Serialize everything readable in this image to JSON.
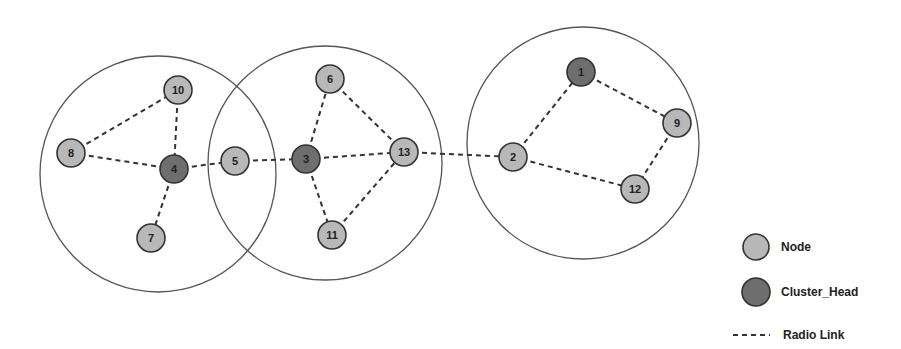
{
  "diagram": {
    "type": "cluster-network-topology",
    "colors": {
      "node_fill": "#b8b8b8",
      "cluster_head_fill": "#6e6e6e",
      "stroke": "#333333",
      "range_circle": "#555555",
      "link": "#333333"
    },
    "ranges": [
      {
        "id": "cluster-4",
        "cx": 158,
        "cy": 174,
        "r": 118
      },
      {
        "id": "cluster-3",
        "cx": 325,
        "cy": 163,
        "r": 117
      },
      {
        "id": "cluster-1",
        "cx": 583,
        "cy": 143,
        "r": 116
      }
    ],
    "nodes": [
      {
        "id": "1",
        "label": "1",
        "x": 581,
        "y": 72,
        "role": "cluster_head"
      },
      {
        "id": "2",
        "label": "2",
        "x": 513,
        "y": 157,
        "role": "node"
      },
      {
        "id": "3",
        "label": "3",
        "x": 306,
        "y": 159,
        "role": "cluster_head"
      },
      {
        "id": "4",
        "label": "4",
        "x": 174,
        "y": 169,
        "role": "cluster_head"
      },
      {
        "id": "5",
        "label": "5",
        "x": 235,
        "y": 161,
        "role": "node"
      },
      {
        "id": "6",
        "label": "6",
        "x": 330,
        "y": 79,
        "role": "node"
      },
      {
        "id": "7",
        "label": "7",
        "x": 151,
        "y": 238,
        "role": "node"
      },
      {
        "id": "8",
        "label": "8",
        "x": 71,
        "y": 153,
        "role": "node"
      },
      {
        "id": "9",
        "label": "9",
        "x": 677,
        "y": 123,
        "role": "node"
      },
      {
        "id": "10",
        "label": "10",
        "x": 178,
        "y": 90,
        "role": "node"
      },
      {
        "id": "11",
        "label": "11",
        "x": 332,
        "y": 235,
        "role": "node"
      },
      {
        "id": "12",
        "label": "12",
        "x": 635,
        "y": 189,
        "role": "node"
      },
      {
        "id": "13",
        "label": "13",
        "x": 404,
        "y": 152,
        "role": "node"
      }
    ],
    "links": [
      [
        "8",
        "10"
      ],
      [
        "10",
        "4"
      ],
      [
        "8",
        "4"
      ],
      [
        "4",
        "7"
      ],
      [
        "4",
        "5"
      ],
      [
        "5",
        "3"
      ],
      [
        "3",
        "6"
      ],
      [
        "6",
        "13"
      ],
      [
        "3",
        "13"
      ],
      [
        "3",
        "11"
      ],
      [
        "11",
        "13"
      ],
      [
        "13",
        "2"
      ],
      [
        "2",
        "1"
      ],
      [
        "1",
        "9"
      ],
      [
        "9",
        "12"
      ],
      [
        "2",
        "12"
      ]
    ]
  },
  "legend": {
    "items": [
      {
        "key": "node",
        "label": "Node"
      },
      {
        "key": "cluster_head",
        "label": "Cluster_Head"
      },
      {
        "key": "radio_link",
        "label": "Radio Link"
      }
    ]
  }
}
